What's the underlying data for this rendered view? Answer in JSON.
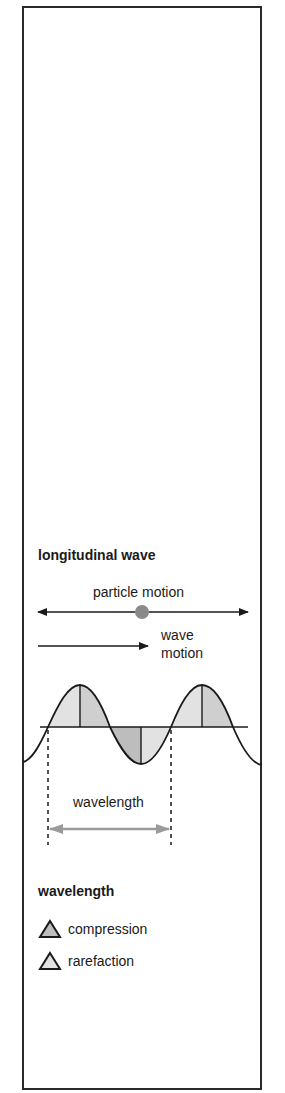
{
  "title": "longitudinal wave",
  "labels": {
    "particle_motion": "particle motion",
    "wave_motion_line1": "wave",
    "wave_motion_line2": "motion",
    "wavelength": "wavelength"
  },
  "legend": {
    "title": "wavelength",
    "items": [
      {
        "label": "compression",
        "icon": "triangle-icon",
        "fill": "#bdbdbd"
      },
      {
        "label": "rarefaction",
        "icon": "triangle-icon",
        "fill": "#e2e2e2"
      }
    ]
  },
  "colors": {
    "line": "#1a1a1a",
    "particle_dot": "#8a8a8a",
    "wavelength_arrow": "#9a9a9a",
    "compression_fill": "#bdbdbd",
    "rarefaction_fill": "#e2e2e2"
  }
}
